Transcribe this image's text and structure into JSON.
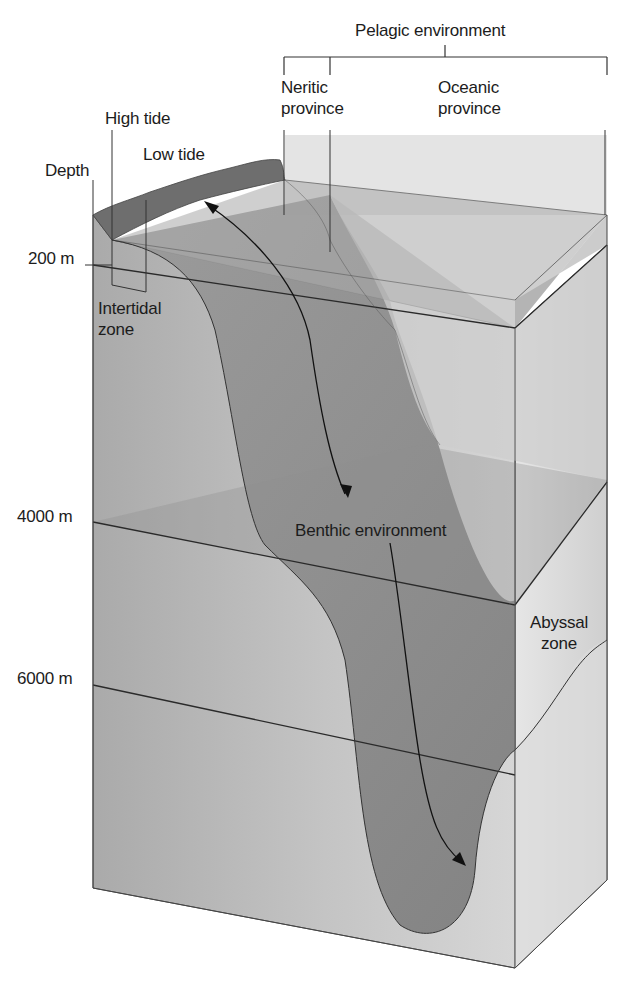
{
  "diagram": {
    "depth_axis": {
      "header": "Depth",
      "ticks": [
        {
          "label": "200 m",
          "y": 265
        },
        {
          "label": "4000 m",
          "y": 522
        },
        {
          "label": "6000 m",
          "y": 685
        }
      ]
    },
    "tide_labels": {
      "high_tide": "High tide",
      "low_tide": "Low tide"
    },
    "zones": {
      "intertidal": {
        "line1": "Intertidal",
        "line2": "zone"
      },
      "abyssal": {
        "line1": "Abyssal",
        "line2": "zone"
      }
    },
    "pelagic": {
      "label": "Pelagic environment",
      "neritic": {
        "line1": "Neritic",
        "line2": "province"
      },
      "oceanic": {
        "line1": "Oceanic",
        "line2": "province"
      }
    },
    "benthic": {
      "label": "Benthic environment"
    },
    "colors": {
      "box_front": "#b4b4b4",
      "box_side": "#d8d8d8",
      "water_slab": "#9e9e9e",
      "seafloor_dark": "#8a8a8a",
      "shore": "#6e6e6e",
      "line": "#2a2a2a",
      "text": "#1c1c1c"
    }
  }
}
